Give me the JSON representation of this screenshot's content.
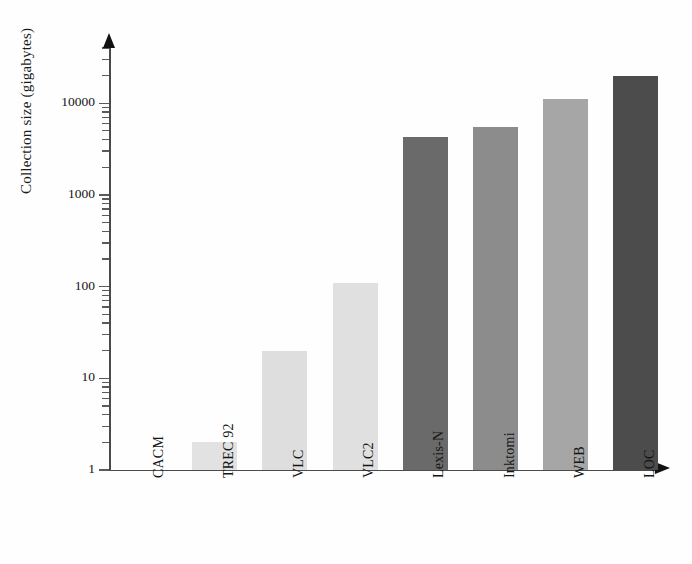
{
  "chart_data": {
    "type": "bar",
    "title": "",
    "xlabel": "",
    "ylabel": "Collection size (gigabytes)",
    "yscale": "log",
    "ylim": [
      1,
      30000
    ],
    "grid": false,
    "legend": false,
    "categories": [
      "CACM",
      "TREC 92",
      "VLC",
      "VLC2",
      "Lexis-N",
      "Inktomi",
      "WEB",
      "LOC"
    ],
    "values": [
      1,
      2,
      20,
      110,
      4300,
      5500,
      11000,
      20000
    ],
    "bar_colors": [
      "#e6e6e6",
      "#e2e2e2",
      "#dedede",
      "#e0e0e0",
      "#6a6a6a",
      "#8c8c8c",
      "#a6a6a6",
      "#4c4c4c"
    ],
    "ytick_labels": [
      "1",
      "10",
      "100",
      "1000",
      "10000"
    ],
    "ytick_values": [
      1,
      10,
      100,
      1000,
      10000
    ],
    "axis_color": "#4b4b4b"
  },
  "axes": {
    "y_title": "Collection size (gigabytes)",
    "y_ticks": [
      {
        "label": "1",
        "value": 1
      },
      {
        "label": "10",
        "value": 10
      },
      {
        "label": "100",
        "value": 100
      },
      {
        "label": "1000",
        "value": 1000
      },
      {
        "label": "10000",
        "value": 10000
      }
    ]
  },
  "categories": [
    {
      "label": "CACM"
    },
    {
      "label": "TREC 92"
    },
    {
      "label": "VLC"
    },
    {
      "label": "VLC2"
    },
    {
      "label": "Lexis-N"
    },
    {
      "label": "Inktomi"
    },
    {
      "label": "WEB"
    },
    {
      "label": "LOC"
    }
  ]
}
